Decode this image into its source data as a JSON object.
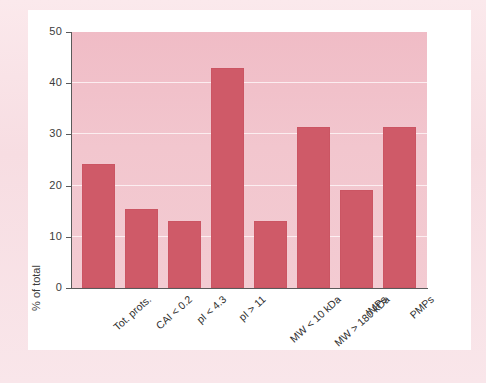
{
  "chart_data": {
    "type": "bar",
    "title": "",
    "subtitle": "",
    "xlabel": "",
    "ylabel": "% of total",
    "categories": [
      "Tot. prots.",
      "CAI < 0.2",
      "pI < 4.3",
      "pI > 11",
      "MW < 10 kDa",
      "MW > 180 kDa",
      "IMPs",
      "PMPs"
    ],
    "values": [
      24.2,
      15.5,
      13.1,
      43.0,
      13.1,
      31.4,
      19.2,
      31.4
    ],
    "ylim": [
      0,
      50
    ],
    "yticks": [
      0,
      10,
      20,
      30,
      40,
      50
    ],
    "ytick_labels": [
      "0",
      "10",
      "20",
      "30",
      "40",
      "50"
    ],
    "grid": true,
    "gridlines_at": [
      10,
      20,
      30,
      40
    ],
    "legend": null,
    "legend_position": "none",
    "annotations": [],
    "colors": {
      "bar": "#cf5a68",
      "plot_background": "#f2c6ce",
      "gridline": "#fdf2f4",
      "axis": "#5a5a5a",
      "text": "#2f2f2f",
      "card_background": "#ffffff",
      "page_background": "#f7dde2"
    }
  }
}
